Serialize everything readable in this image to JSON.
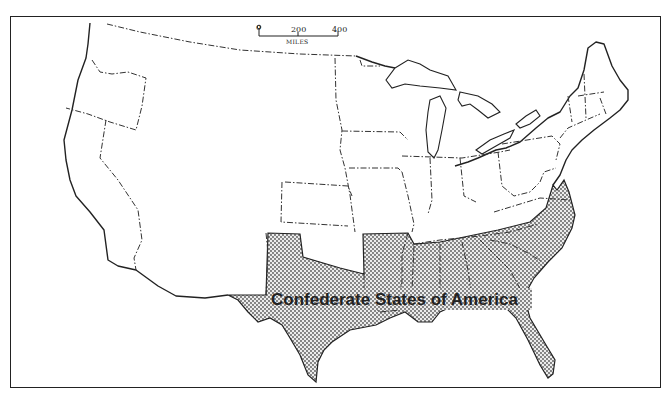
{
  "map": {
    "title": "Confederate States of America",
    "region_label": "Confederate States of America",
    "shading": {
      "style": "stipple-dots",
      "fill_color": "#bdbdbd",
      "dot_color": "#555555",
      "background": "#ffffff",
      "line_color": "#222222"
    },
    "scale_bar": {
      "ticks": [
        "0",
        "200",
        "400"
      ],
      "units": "MILES"
    },
    "confederate_states": [
      "Texas",
      "Arkansas",
      "Louisiana",
      "Mississippi",
      "Alabama",
      "Tennessee",
      "Georgia",
      "Florida",
      "South Carolina",
      "North Carolina",
      "Virginia",
      "Indian Territory (southern)",
      "Arizona Territory (southern)"
    ]
  }
}
